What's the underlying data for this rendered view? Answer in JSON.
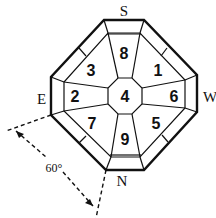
{
  "diagram": {
    "type": "octagonal nine-palace compass diagram",
    "directions": {
      "top": "S",
      "right": "W",
      "bottom": "N",
      "left": "E"
    },
    "cells": {
      "top": "8",
      "top_right": "1",
      "right": "6",
      "bottom_right": "5",
      "bottom": "9",
      "bottom_left": "7",
      "left": "2",
      "top_left": "3",
      "center": "4"
    },
    "angle_label": "60°",
    "colors": {
      "line": "#111111",
      "background": "#ffffff"
    }
  }
}
